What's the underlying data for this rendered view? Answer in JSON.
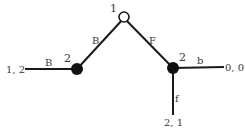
{
  "diagram": {
    "type": "extensive-form game tree",
    "nodes": [
      {
        "id": "root",
        "player": "1",
        "style": "open"
      },
      {
        "id": "left",
        "player": "2",
        "style": "filled"
      },
      {
        "id": "right",
        "player": "2",
        "style": "filled"
      }
    ],
    "edges": [
      {
        "from": "root",
        "to": "left",
        "action": "B"
      },
      {
        "from": "root",
        "to": "right",
        "action": "F"
      },
      {
        "from": "left",
        "to": "t1",
        "action": "B"
      },
      {
        "from": "right",
        "to": "t2",
        "action": "b"
      },
      {
        "from": "right",
        "to": "t3",
        "action": "f"
      }
    ],
    "terminals": [
      {
        "id": "t1",
        "payoff": "1, 2"
      },
      {
        "id": "t2",
        "payoff": "0, 0"
      },
      {
        "id": "t3",
        "payoff": "2, 1"
      }
    ]
  }
}
